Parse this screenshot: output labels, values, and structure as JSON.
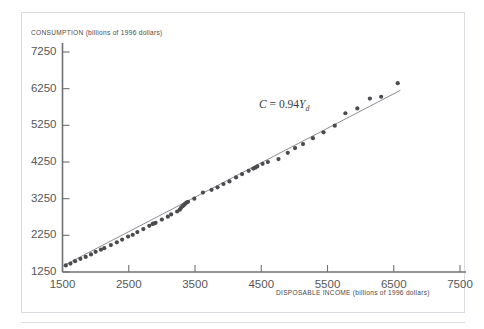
{
  "chart_data": {
    "type": "scatter",
    "title": "",
    "xlabel": "DISPOSABLE INCOME (billions of 1996 dollars)",
    "ylabel": "CONSUMPTION (billions of 1996 dollars)",
    "xlim": [
      1500,
      7500
    ],
    "ylim": [
      1250,
      7250
    ],
    "xticks": [
      1500,
      2500,
      3500,
      4500,
      5500,
      6500,
      7500
    ],
    "yticks": [
      1250,
      2250,
      3250,
      4250,
      5250,
      6250,
      7250
    ],
    "xtick_labels": [
      "1500",
      "2500",
      "3500",
      "4500",
      "5500",
      "6500",
      "7500"
    ],
    "ytick_labels": [
      "1250",
      "2250",
      "3250",
      "4250",
      "5250",
      "6250",
      "7250"
    ],
    "grid": false,
    "legend": "none",
    "annotations": [
      {
        "name": "regression-equation",
        "text": "C = 0.94Yd",
        "text_parts": {
          "lhs": "C",
          "equals": " = ",
          "coefficient": "0.94",
          "variable": "Y",
          "subscript": "d"
        },
        "x": 4500,
        "y": 5600
      }
    ],
    "series": [
      {
        "name": "Consumption vs disposable income",
        "type": "scatter",
        "marker": "circle",
        "color": "#4b4b4f",
        "points": [
          [
            1550,
            1430
          ],
          [
            1620,
            1480
          ],
          [
            1690,
            1545
          ],
          [
            1770,
            1610
          ],
          [
            1850,
            1660
          ],
          [
            1930,
            1730
          ],
          [
            2000,
            1800
          ],
          [
            2080,
            1860
          ],
          [
            2130,
            1900
          ],
          [
            2230,
            1985
          ],
          [
            2320,
            2060
          ],
          [
            2400,
            2135
          ],
          [
            2490,
            2215
          ],
          [
            2560,
            2265
          ],
          [
            2630,
            2340
          ],
          [
            2720,
            2420
          ],
          [
            2810,
            2510
          ],
          [
            2860,
            2560
          ],
          [
            2880,
            2575
          ],
          [
            2905,
            2590
          ],
          [
            3000,
            2680
          ],
          [
            3090,
            2760
          ],
          [
            3140,
            2820
          ],
          [
            3230,
            2900
          ],
          [
            3270,
            2950
          ],
          [
            3290,
            3000
          ],
          [
            3310,
            3040
          ],
          [
            3325,
            3065
          ],
          [
            3340,
            3090
          ],
          [
            3350,
            3110
          ],
          [
            3370,
            3140
          ],
          [
            3395,
            3165
          ],
          [
            3490,
            3250
          ],
          [
            3620,
            3415
          ],
          [
            3750,
            3490
          ],
          [
            3840,
            3560
          ],
          [
            3930,
            3650
          ],
          [
            4020,
            3720
          ],
          [
            4120,
            3830
          ],
          [
            4210,
            3920
          ],
          [
            4310,
            4010
          ],
          [
            4380,
            4070
          ],
          [
            4410,
            4095
          ],
          [
            4440,
            4130
          ],
          [
            4520,
            4200
          ],
          [
            4600,
            4250
          ],
          [
            4760,
            4330
          ],
          [
            4900,
            4500
          ],
          [
            5010,
            4630
          ],
          [
            5130,
            4740
          ],
          [
            5280,
            4900
          ],
          [
            5440,
            5060
          ],
          [
            5610,
            5240
          ],
          [
            5770,
            5580
          ],
          [
            5950,
            5710
          ],
          [
            6140,
            5980
          ],
          [
            6310,
            6030
          ],
          [
            6560,
            6400
          ]
        ]
      },
      {
        "name": "Fitted line C = 0.94Yd",
        "type": "line",
        "color": "#8e8e93",
        "slope": 0.94,
        "intercept": 0,
        "x_range": [
          1500,
          6600
        ]
      }
    ]
  },
  "axes": {
    "x_title": "DISPOSABLE INCOME (billions of 1996 dollars)",
    "y_title": "CONSUMPTION (billions of 1996 dollars)"
  },
  "colors": {
    "point": "#4b4b4f",
    "line": "#8e8e93",
    "axis": "#6e7074",
    "tick_text": "#55575a",
    "title_text": "#4a4a4a",
    "frame": "#d9dde2",
    "background": "#ffffff"
  }
}
